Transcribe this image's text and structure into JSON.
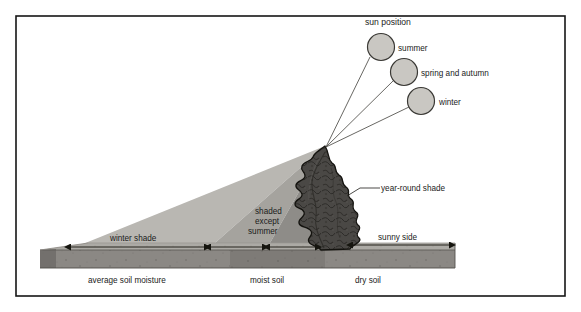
{
  "diagram": {
    "title_label": "sun position",
    "sun_positions": [
      {
        "id": "summer",
        "label": "summer",
        "cx": 381,
        "cy": 47,
        "r": 13.5,
        "label_x": 398,
        "label_y": 51
      },
      {
        "id": "spring_autumn",
        "label": "spring and autumn",
        "cx": 404,
        "cy": 72,
        "r": 13.5,
        "label_x": 421,
        "label_y": 76
      },
      {
        "id": "winter",
        "label": "winter",
        "cx": 421,
        "cy": 101,
        "r": 13.5,
        "label_x": 439,
        "label_y": 105
      }
    ],
    "apex": {
      "x": 325,
      "y": 146
    },
    "shade_zones": [
      {
        "id": "winter-shade",
        "label": "winter shade",
        "label_x": 148,
        "label_y": 240,
        "tone": "#b9b7b2",
        "ground_start_x": 68,
        "ground_end_x": 207
      },
      {
        "id": "shaded-except-summer",
        "label_lines": [
          "shaded",
          "except",
          "summer"
        ],
        "label_x": 273,
        "label_y": 216,
        "tone": "#a5a39e",
        "ground_start_x": 207,
        "ground_end_x": 266
      },
      {
        "id": "year-round-shade",
        "label": "year-round shade",
        "label_x": 383,
        "label_y": 188,
        "tone": "#8e8c88",
        "ground_start_x": 266,
        "ground_end_x": 318
      }
    ],
    "sunny_side": {
      "label": "sunny side",
      "label_x": 408,
      "label_y": 240,
      "ground_start_x": 350,
      "ground_end_x": 452
    },
    "soil_bands": [
      {
        "id": "average-soil-moisture",
        "label": "average soil moisture",
        "label_x": 122,
        "label_y": 281,
        "tone": "#8b8884"
      },
      {
        "id": "moist-soil",
        "label": "moist soil",
        "label_x": 275,
        "label_y": 281,
        "tone": "#7e7b77"
      },
      {
        "id": "dry-soil",
        "label": "dry soil",
        "label_x": 372,
        "label_y": 281,
        "tone": "#8b8884"
      }
    ],
    "tree": {
      "id": "tree",
      "label": "year-round shade",
      "fill": "#4a4845",
      "outline": "#14130f"
    },
    "colors": {
      "frame": "#161616",
      "sun_fill": "#c9c7c2",
      "sun_stroke": "#3a3935",
      "ray": "#4d4b47",
      "ground_top": "#b0ada8",
      "ground_front": "#7e7b77",
      "arrow": "#16150f",
      "text": "#1b1b1b"
    }
  }
}
